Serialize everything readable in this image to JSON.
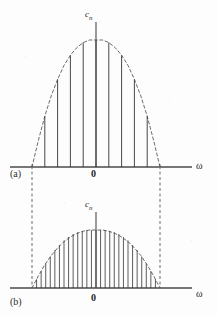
{
  "figure": {
    "panels": [
      {
        "id": "a",
        "tag": "(a)",
        "y_axis_label": "c",
        "y_axis_sub": "n",
        "x_axis_label": "ω",
        "origin_label": "0"
      },
      {
        "id": "b",
        "tag": "(b)",
        "y_axis_label": "c",
        "y_axis_sub": "n",
        "x_axis_label": "ω",
        "origin_label": "0"
      }
    ]
  },
  "chart_data": [
    {
      "type": "bar",
      "id": "panel-a",
      "title": "",
      "xlabel": "ω",
      "ylabel": "c_n",
      "origin_label": "0",
      "panel_tag": "(a)",
      "xlim": [
        -1.35,
        1.35
      ],
      "ylim": [
        0,
        1.12
      ],
      "grid": false,
      "legend": "none",
      "envelope": {
        "style": "dashed",
        "description": "parabolic/cosine-like envelope peaking at ω = 0",
        "x": [
          -1.0,
          -0.9,
          -0.8,
          -0.7,
          -0.6,
          -0.5,
          -0.4,
          -0.3,
          -0.2,
          -0.1,
          0.0,
          0.1,
          0.2,
          0.3,
          0.4,
          0.5,
          0.6,
          0.7,
          0.8,
          0.9,
          1.0
        ],
        "y": [
          0.0,
          0.21,
          0.4,
          0.56,
          0.69,
          0.8,
          0.88,
          0.94,
          0.98,
          1.0,
          1.0,
          1.0,
          0.98,
          0.94,
          0.88,
          0.8,
          0.69,
          0.56,
          0.4,
          0.21,
          0.0
        ]
      },
      "line_spacing": 0.2,
      "x_values": [
        -1.0,
        -0.8,
        -0.6,
        -0.4,
        -0.2,
        0.0,
        0.2,
        0.4,
        0.6,
        0.8,
        1.0
      ],
      "values": [
        0.02,
        0.4,
        0.69,
        0.88,
        0.98,
        1.0,
        0.98,
        0.88,
        0.69,
        0.4,
        0.02
      ]
    },
    {
      "type": "bar",
      "id": "panel-b",
      "title": "",
      "xlabel": "ω",
      "ylabel": "c_n",
      "origin_label": "0",
      "panel_tag": "(b)",
      "xlim": [
        -1.35,
        1.35
      ],
      "ylim": [
        0,
        1.12
      ],
      "grid": false,
      "legend": "none",
      "envelope": {
        "style": "dashed",
        "description": "same envelope shape, lower amplitude, denser lines",
        "x": [
          -1.0,
          -0.9,
          -0.8,
          -0.7,
          -0.6,
          -0.5,
          -0.4,
          -0.3,
          -0.2,
          -0.1,
          0.0,
          0.1,
          0.2,
          0.3,
          0.4,
          0.5,
          0.6,
          0.7,
          0.8,
          0.9,
          1.0
        ],
        "y": [
          0.0,
          0.21,
          0.4,
          0.56,
          0.69,
          0.8,
          0.88,
          0.94,
          0.98,
          1.0,
          1.0,
          1.0,
          0.98,
          0.94,
          0.88,
          0.8,
          0.69,
          0.56,
          0.4,
          0.21,
          0.0
        ]
      },
      "line_spacing": 0.0714,
      "x_values": [
        -1.0,
        -0.9286,
        -0.8571,
        -0.7857,
        -0.7143,
        -0.6429,
        -0.5714,
        -0.5,
        -0.4286,
        -0.3571,
        -0.2857,
        -0.2143,
        -0.1429,
        -0.0714,
        0.0,
        0.0714,
        0.1429,
        0.2143,
        0.2857,
        0.3571,
        0.4286,
        0.5,
        0.5714,
        0.6429,
        0.7143,
        0.7857,
        0.8571,
        0.9286,
        1.0
      ],
      "values": [
        0.02,
        0.15,
        0.29,
        0.42,
        0.54,
        0.65,
        0.74,
        0.82,
        0.88,
        0.93,
        0.96,
        0.98,
        1.0,
        1.0,
        1.0,
        1.0,
        1.0,
        0.98,
        0.96,
        0.93,
        0.88,
        0.82,
        0.74,
        0.65,
        0.54,
        0.42,
        0.29,
        0.15,
        0.02
      ]
    }
  ],
  "connectors": {
    "description": "dashed vertical lines joining the band edges of panel (a) to panel (b)",
    "left_x": -1.0,
    "right_x": 1.0
  },
  "colors": {
    "ink": "#333333",
    "axis": "#4a4a4a",
    "envelope": "#6b6b6b",
    "background": "#fdfdfd"
  }
}
